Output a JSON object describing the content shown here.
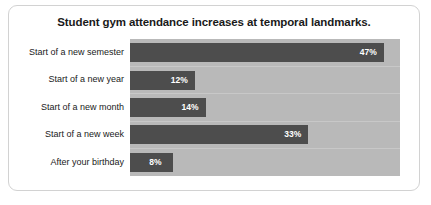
{
  "chart_data": {
    "type": "bar",
    "orientation": "horizontal",
    "title": "Student gym attendance increases at temporal landmarks.",
    "xlabel": "",
    "ylabel": "",
    "categories": [
      "Start of a new semester",
      "Start of a new year",
      "Start of a new month",
      "Start of a new week",
      "After your birthday"
    ],
    "values": [
      47,
      12,
      14,
      33,
      8
    ],
    "value_labels": [
      "47%",
      "12%",
      "14%",
      "33%",
      "8%"
    ],
    "unit": "%",
    "xlim": [
      0,
      50
    ],
    "grid": true,
    "legend": "none",
    "colors": {
      "bar": "#4d4d4d",
      "plot_background": "#b9b9b9",
      "grid_line": "#c8c8c8",
      "value_label": "#ffffff",
      "category_label": "#1a1a1a",
      "title": "#1a1a1a",
      "card_border": "#d2d2d2",
      "page_background": "#ffffff"
    }
  }
}
